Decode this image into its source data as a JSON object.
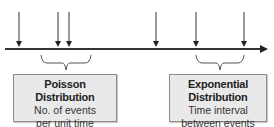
{
  "diagram": {
    "timeline": {
      "y": 49,
      "x_start": 5,
      "x_end": 262,
      "color": "#333333"
    },
    "event_arrows_x": [
      19,
      58,
      69,
      156,
      196,
      244
    ],
    "arrow_color": "#555555",
    "braces": [
      {
        "name": "poisson-brace",
        "x_start": 41,
        "x_end": 91
      },
      {
        "name": "exponential-brace",
        "x_start": 196,
        "x_end": 244
      }
    ],
    "poisson": {
      "title": "Poisson Distribution",
      "line1": "No. of events",
      "line2": "per unit time"
    },
    "exponential": {
      "title": "Exponential Distribution",
      "line1": "Time interval",
      "line2": "between events"
    },
    "box_fill": "#e9e9e9",
    "box_border": "#8a8a8a"
  }
}
